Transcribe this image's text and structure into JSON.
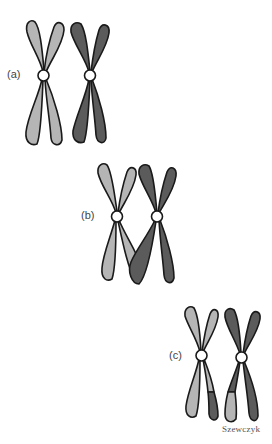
{
  "figure": {
    "panels": [
      {
        "id": "a",
        "label": "(a)",
        "description": "homologous chromosome pair before crossing over"
      },
      {
        "id": "b",
        "label": "(b)",
        "description": "chromatids crossing over"
      },
      {
        "id": "c",
        "label": "(c)",
        "description": "chromosomes after exchange of segments"
      }
    ],
    "signature": "Szewczyk"
  },
  "colors": {
    "light_chromosome": "#b5b5b5",
    "dark_chromosome": "#5b5b5b",
    "outline": "#1a1a1a",
    "centromere": "#ffffff"
  }
}
